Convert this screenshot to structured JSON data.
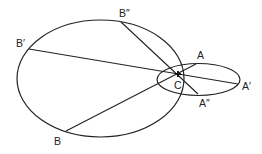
{
  "diagram": {
    "stroke_color": "#222222",
    "background": "#ffffff",
    "ellipses": [
      {
        "name": "large-ellipse",
        "cx": 100.5,
        "cy": 78.5,
        "rx": 83.5,
        "ry": 58.5
      },
      {
        "name": "small-ellipse",
        "cx": 198.5,
        "cy": 79.5,
        "rx": 41.5,
        "ry": 16
      }
    ],
    "center": {
      "label": "C",
      "x": 178,
      "y": 74
    },
    "points": {
      "A": {
        "label": "A",
        "x": 196,
        "y": 64
      },
      "A1": {
        "label": "A′",
        "x": 238,
        "y": 84
      },
      "A2": {
        "label": "A″",
        "x": 198,
        "y": 94
      },
      "B": {
        "label": "B",
        "x": 66,
        "y": 131
      },
      "B1": {
        "label": "B′",
        "x": 29,
        "y": 49
      },
      "B2": {
        "label": "B″",
        "x": 121,
        "y": 22
      }
    },
    "chords": [
      {
        "from": "B",
        "to": "A",
        "through": "C"
      },
      {
        "from": "B1",
        "to": "A1",
        "through": "C"
      },
      {
        "from": "B2",
        "to": "A2",
        "through": "C"
      }
    ],
    "labels": {
      "A": "A",
      "A1": "A′",
      "A2": "A″",
      "B": "B",
      "B1": "B′",
      "B2": "B″",
      "C": "C"
    }
  }
}
